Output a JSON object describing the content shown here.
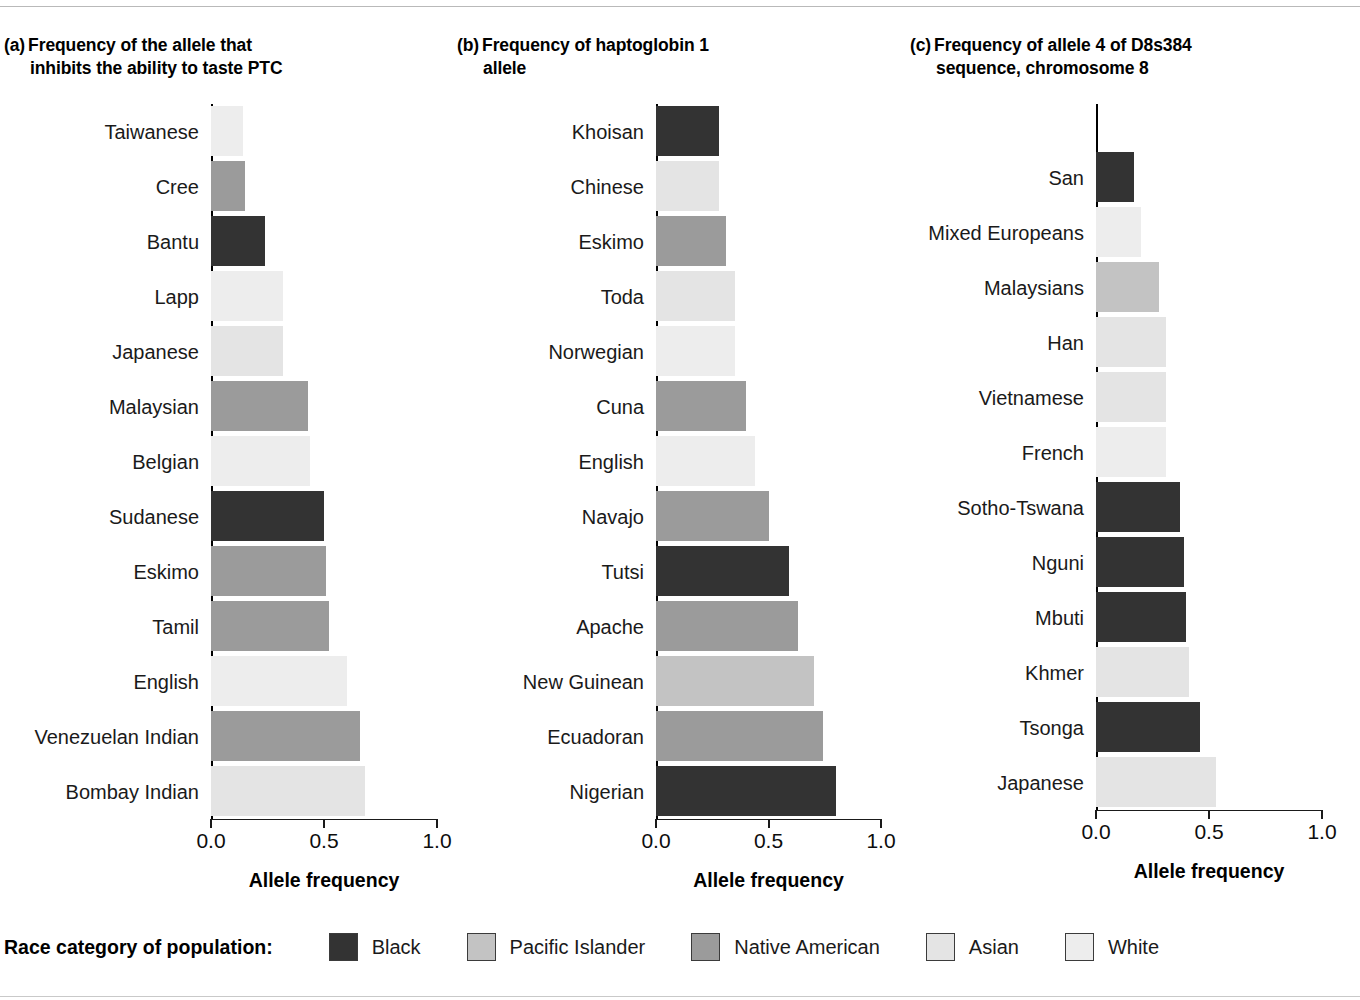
{
  "figure": {
    "xlabel": "Allele frequency",
    "legend_title": "Race category of population:"
  },
  "legend": {
    "items": [
      {
        "label": "Black",
        "key": "black",
        "color": "#333333"
      },
      {
        "label": "Pacific Islander",
        "key": "pacific",
        "color": "#c3c3c3"
      },
      {
        "label": "Native American",
        "key": "native",
        "color": "#9b9b9b"
      },
      {
        "label": "Asian",
        "key": "asian",
        "color": "#e4e4e4"
      },
      {
        "label": "White",
        "key": "white",
        "color": "#ededed"
      }
    ]
  },
  "chart_data": [
    {
      "type": "bar",
      "orientation": "horizontal",
      "panel": "(a)",
      "title_line1": "Frequency of the allele that",
      "title_line2": "inhibits the ability to taste PTC",
      "xlabel": "Allele frequency",
      "ylabel": "",
      "xlim": [
        0,
        1
      ],
      "xticks": [
        "0.0",
        "0.5",
        "1.0"
      ],
      "xtickvals": [
        0,
        0.5,
        1
      ],
      "grid": false,
      "categories": [
        "Taiwanese",
        "Cree",
        "Bantu",
        "Lapp",
        "Japanese",
        "Malaysian",
        "Belgian",
        "Sudanese",
        "Eskimo",
        "Tamil",
        "English",
        "Venezuelan Indian",
        "Bombay Indian"
      ],
      "values": [
        0.14,
        0.15,
        0.24,
        0.32,
        0.32,
        0.43,
        0.44,
        0.5,
        0.51,
        0.52,
        0.6,
        0.66,
        0.68
      ],
      "race": [
        "white",
        "native",
        "black",
        "white",
        "asian",
        "native",
        "white",
        "black",
        "native",
        "native",
        "white",
        "native",
        "asian"
      ]
    },
    {
      "type": "bar",
      "orientation": "horizontal",
      "panel": "(b)",
      "title_line1": "Frequency of haptoglobin 1",
      "title_line2": "allele",
      "xlabel": "Allele frequency",
      "ylabel": "",
      "xlim": [
        0,
        1
      ],
      "xticks": [
        "0.0",
        "0.5",
        "1.0"
      ],
      "xtickvals": [
        0,
        0.5,
        1
      ],
      "grid": false,
      "categories": [
        "Khoisan",
        "Chinese",
        "Eskimo",
        "Toda",
        "Norwegian",
        "Cuna",
        "English",
        "Navajo",
        "Tutsi",
        "Apache",
        "New Guinean",
        "Ecuadoran",
        "Nigerian"
      ],
      "values": [
        0.28,
        0.28,
        0.31,
        0.35,
        0.35,
        0.4,
        0.44,
        0.5,
        0.59,
        0.63,
        0.7,
        0.74,
        0.8
      ],
      "race": [
        "black",
        "asian",
        "native",
        "asian",
        "white",
        "native",
        "white",
        "native",
        "black",
        "native",
        "pacific",
        "native",
        "black"
      ]
    },
    {
      "type": "bar",
      "orientation": "horizontal",
      "panel": "(c)",
      "title_line1": "Frequency of allele 4 of D8s384",
      "title_line2": "sequence, chromosome 8",
      "xlabel": "Allele frequency",
      "ylabel": "",
      "xlim": [
        0,
        1
      ],
      "xticks": [
        "0.0",
        "0.5",
        "1.0"
      ],
      "xtickvals": [
        0,
        0.5,
        1
      ],
      "grid": false,
      "categories": [
        "San",
        "Mixed Europeans",
        "Malaysians",
        "Han",
        "Vietnamese",
        "French",
        "Sotho-Tswana",
        "Nguni",
        "Mbuti",
        "Khmer",
        "Tsonga",
        "Japanese"
      ],
      "values": [
        0.17,
        0.2,
        0.28,
        0.31,
        0.31,
        0.31,
        0.37,
        0.39,
        0.4,
        0.41,
        0.46,
        0.53
      ],
      "race": [
        "black",
        "white",
        "pacific",
        "asian",
        "asian",
        "white",
        "black",
        "black",
        "black",
        "asian",
        "black",
        "asian"
      ]
    }
  ]
}
